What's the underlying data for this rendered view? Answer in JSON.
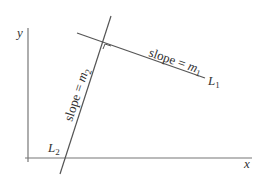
{
  "diagram": {
    "axes": {
      "x_label": "x",
      "y_label": "y"
    },
    "lines": [
      {
        "name": "L",
        "subscript": "1",
        "slope_text": "slope = ",
        "slope_var": "m",
        "slope_sub": "1"
      },
      {
        "name": "L",
        "subscript": "2",
        "slope_text": "slope = ",
        "slope_var": "m",
        "slope_sub": "2"
      }
    ],
    "right_angle_marker": true,
    "colors": {
      "axis": "#666666",
      "line": "#555555",
      "text": "#333333"
    }
  }
}
